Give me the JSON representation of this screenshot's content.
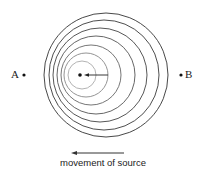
{
  "diagram": {
    "type": "doppler-effect-wavefronts",
    "point_a": {
      "label": "A",
      "x": 24,
      "y": 75
    },
    "point_b": {
      "label": "B",
      "x": 181,
      "y": 75
    },
    "source": {
      "x": 80,
      "y": 75
    },
    "source_arrow": {
      "from_x": 108,
      "to_x": 84,
      "y": 75
    },
    "wavefronts": [
      {
        "cx": 106,
        "cy": 75,
        "r": 62,
        "color": "#333333"
      },
      {
        "cx": 104,
        "cy": 75,
        "r": 55,
        "color": "#3a3a3a"
      },
      {
        "cx": 100,
        "cy": 75,
        "r": 47,
        "color": "#444444"
      },
      {
        "cx": 96,
        "cy": 75,
        "r": 39,
        "color": "#555555"
      },
      {
        "cx": 91,
        "cy": 75,
        "r": 30,
        "color": "#666666"
      },
      {
        "cx": 86,
        "cy": 75,
        "r": 22,
        "color": "#888888"
      },
      {
        "cx": 82,
        "cy": 75,
        "r": 14,
        "color": "#aaaaaa"
      }
    ],
    "movement_arrow": {
      "from_x": 124,
      "to_x": 71,
      "y": 153
    },
    "caption": "movement of source"
  }
}
